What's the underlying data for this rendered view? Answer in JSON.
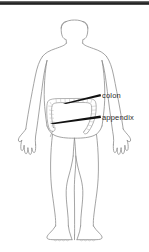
{
  "figure": {
    "organ_drawn": "large intestine (colon) with appendix",
    "line_color": "#8d8d8d",
    "organ_color": "#9a9a9a",
    "pointer_color": "#111111",
    "background_color": "#ffffff"
  },
  "topbar": {
    "color": "#2a2a2a"
  },
  "labels": {
    "colon": "colon",
    "appendix": "appendix"
  },
  "pointers": [
    {
      "name": "colon-pointer",
      "label": "colon",
      "from_x": 100,
      "from_y": 95,
      "to_x": 63,
      "to_y": 103
    },
    {
      "name": "appendix-pointer",
      "label": "appendix",
      "from_x": 100,
      "from_y": 117,
      "to_x": 50,
      "to_y": 123
    }
  ]
}
